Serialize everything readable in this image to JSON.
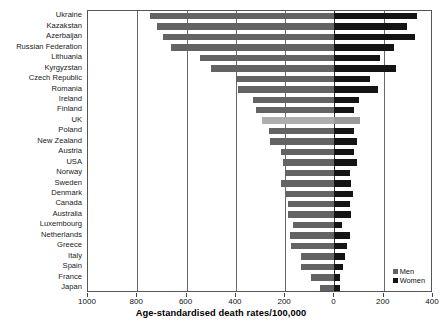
{
  "chart_data": {
    "type": "bar",
    "orientation": "horizontal-diverging",
    "title": "",
    "xlabel": "Age-standardised death rates/100,000",
    "ylabel": "",
    "grid": true,
    "legend_position": "bottom-right-inside",
    "axis": {
      "left_max": 1000,
      "right_max": 400,
      "tick_values": [
        1000,
        800,
        600,
        400,
        200,
        0,
        200,
        400
      ],
      "tick_labels": [
        "1000",
        "800",
        "600",
        "400",
        "200",
        "0",
        "200",
        "400"
      ]
    },
    "colors": {
      "men": "#636363",
      "women": "#141414",
      "men_highlight": "#aeaeae",
      "women_highlight": "#9a9a9a"
    },
    "categories": [
      "Ukraine",
      "Kazakstan",
      "Azerbaijan",
      "Russian Federation",
      "Lithuania",
      "Kyrgyzstan",
      "Czech Republic",
      "Romania",
      "Ireland",
      "Finland",
      "UK",
      "Poland",
      "New Zealand",
      "Austria",
      "USA",
      "Norway",
      "Sweden",
      "Denmark",
      "Canada",
      "Australia",
      "Luxembourg",
      "Netherlands",
      "Greece",
      "Italy",
      "Spain",
      "France",
      "Japan"
    ],
    "series": [
      {
        "name": "Men",
        "side": "left",
        "values": [
          750,
          720,
          695,
          665,
          545,
          500,
          400,
          390,
          330,
          320,
          295,
          265,
          260,
          215,
          210,
          200,
          215,
          195,
          190,
          190,
          170,
          180,
          175,
          135,
          135,
          95,
          60
        ]
      },
      {
        "name": "Women",
        "side": "right",
        "values": [
          335,
          295,
          325,
          240,
          185,
          250,
          145,
          175,
          100,
          80,
          105,
          80,
          90,
          80,
          92,
          62,
          68,
          75,
          63,
          68,
          32,
          62,
          50,
          42,
          35,
          22,
          22
        ]
      }
    ],
    "highlight_category": "UK"
  },
  "legend": {
    "items": [
      {
        "label": "Men"
      },
      {
        "label": "Women"
      }
    ]
  }
}
